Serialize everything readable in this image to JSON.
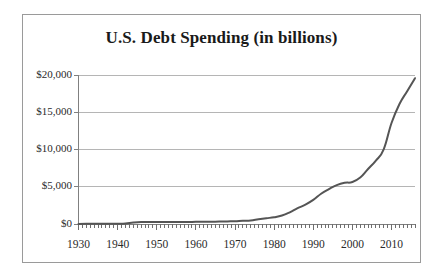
{
  "figure": {
    "background_color": "#ffffff",
    "border_color": "#9a9a9a"
  },
  "chart_data": {
    "type": "line",
    "title": "U.S. Debt Spending (in billions)",
    "xlabel": "",
    "ylabel": "",
    "grid": true,
    "legend": false,
    "line_color": "#555555",
    "gridline_color": "#b5b5b5",
    "axis_color": "#808080",
    "xlim": [
      1930,
      2016
    ],
    "ylim": [
      0,
      20000
    ],
    "ytick_labels": [
      "$0",
      "$5,000",
      "$10,000",
      "$15,000",
      "$20,000"
    ],
    "ytick_values": [
      0,
      5000,
      10000,
      15000,
      20000
    ],
    "xtick_labels": [
      "1930",
      "1940",
      "1950",
      "1960",
      "1970",
      "1980",
      "1990",
      "2000",
      "2010"
    ],
    "xtick_values": [
      1930,
      1940,
      1950,
      1960,
      1970,
      1980,
      1990,
      2000,
      2010
    ],
    "minor_xtick_interval": 1,
    "x": [
      1930,
      1932,
      1934,
      1936,
      1938,
      1940,
      1942,
      1944,
      1946,
      1948,
      1950,
      1952,
      1954,
      1956,
      1958,
      1960,
      1962,
      1964,
      1966,
      1968,
      1970,
      1972,
      1974,
      1976,
      1978,
      1980,
      1982,
      1984,
      1986,
      1988,
      1990,
      1992,
      1994,
      1996,
      1998,
      2000,
      2002,
      2004,
      2006,
      2008,
      2010,
      2012,
      2014,
      2016
    ],
    "values": [
      16,
      19,
      27,
      34,
      37,
      43,
      72,
      201,
      269,
      252,
      257,
      259,
      271,
      273,
      276,
      286,
      298,
      312,
      320,
      348,
      371,
      436,
      475,
      629,
      772,
      908,
      1137,
      1572,
      2125,
      2602,
      3233,
      4065,
      4693,
      5225,
      5526,
      5629,
      6228,
      7379,
      8507,
      10025,
      13562,
      16066,
      17824,
      19573
    ],
    "series": [
      {
        "name": "U.S. Debt Spending",
        "values": [
          16,
          19,
          27,
          34,
          37,
          43,
          72,
          201,
          269,
          252,
          257,
          259,
          271,
          273,
          276,
          286,
          298,
          312,
          320,
          348,
          371,
          436,
          475,
          629,
          772,
          908,
          1137,
          1572,
          2125,
          2602,
          3233,
          4065,
          4693,
          5225,
          5526,
          5629,
          6228,
          7379,
          8507,
          10025,
          13562,
          16066,
          17824,
          19573
        ]
      }
    ],
    "annotations": []
  }
}
